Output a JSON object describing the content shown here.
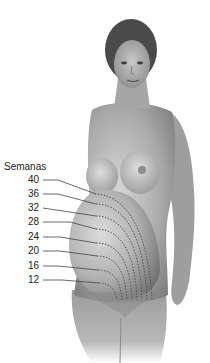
{
  "diagram": {
    "title": "Semanas",
    "weeks": [
      "40",
      "36",
      "32",
      "28",
      "24",
      "20",
      "16",
      "12"
    ],
    "colors": {
      "skin_light": "#d8d8d8",
      "skin_mid": "#a8a8a8",
      "skin_dark": "#6e6e6e",
      "hair": "#4a4a4a",
      "leader_line": "#444444",
      "dotted_arc": "#555555",
      "text": "#222222"
    }
  }
}
